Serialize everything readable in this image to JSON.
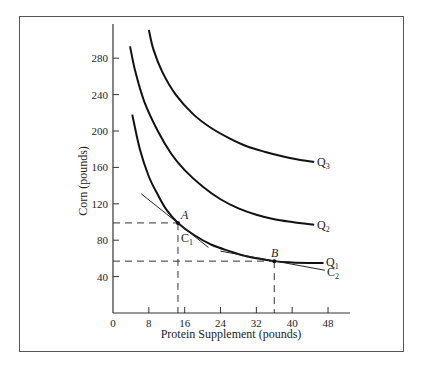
{
  "chart_data": {
    "type": "line",
    "title": "",
    "xlabel": "Protein Supplement (pounds)",
    "ylabel": "Corn (pounds)",
    "xlim": [
      0,
      52
    ],
    "ylim": [
      0,
      310
    ],
    "x_ticks": [
      0,
      8,
      16,
      24,
      32,
      40,
      48
    ],
    "y_ticks": [
      40,
      80,
      120,
      160,
      200,
      240,
      280
    ],
    "grid": false,
    "legend": "none (curves labeled at right ends)",
    "series": [
      {
        "name": "Q1",
        "label": "Q",
        "sub": "1",
        "points": [
          [
            4.3,
            218
          ],
          [
            6,
            180
          ],
          [
            8,
            150
          ],
          [
            10,
            130
          ],
          [
            12,
            113
          ],
          [
            14.5,
            99
          ],
          [
            18,
            86
          ],
          [
            22,
            75
          ],
          [
            26,
            68
          ],
          [
            30,
            62
          ],
          [
            36,
            57
          ],
          [
            40,
            55.5
          ],
          [
            44,
            55
          ],
          [
            47,
            55
          ]
        ]
      },
      {
        "name": "Q2",
        "label": "Q",
        "sub": "2",
        "points": [
          [
            3.8,
            293
          ],
          [
            5,
            265
          ],
          [
            7,
            232
          ],
          [
            10,
            200
          ],
          [
            13,
            175
          ],
          [
            16,
            157
          ],
          [
            20,
            139
          ],
          [
            24,
            125
          ],
          [
            28,
            115
          ],
          [
            32,
            108
          ],
          [
            36,
            103
          ],
          [
            40,
            100
          ],
          [
            44.9,
            97
          ]
        ]
      },
      {
        "name": "Q3",
        "label": "Q",
        "sub": "3",
        "points": [
          [
            8,
            311
          ],
          [
            9,
            290
          ],
          [
            11,
            265
          ],
          [
            14,
            240
          ],
          [
            18,
            218
          ],
          [
            22,
            203
          ],
          [
            26,
            192
          ],
          [
            30,
            183
          ],
          [
            34,
            177
          ],
          [
            38,
            172
          ],
          [
            41,
            169
          ],
          [
            44.9,
            166
          ]
        ]
      }
    ],
    "tangent_lines": [
      {
        "name": "C1",
        "label": "C",
        "sub": "1",
        "from": [
          6.3,
          131
        ],
        "to": [
          21.3,
          72
        ]
      },
      {
        "name": "C2",
        "label": "C",
        "sub": "2",
        "from": [
          24,
          68
        ],
        "to": [
          47.3,
          47
        ]
      }
    ],
    "annotations": [
      {
        "label": "A",
        "x": 14.5,
        "y": 99,
        "dashed_to_axes": true
      },
      {
        "label": "B",
        "x": 36,
        "y": 57,
        "dashed_to_axes": true
      }
    ]
  },
  "labels": {
    "x_axis_title": "Protein Supplement (pounds)",
    "y_axis_title": "Corn (pounds)",
    "point_a": "A",
    "point_b": "B",
    "q": "Q",
    "c": "C",
    "sub1": "1",
    "sub2": "2",
    "sub3": "3"
  }
}
